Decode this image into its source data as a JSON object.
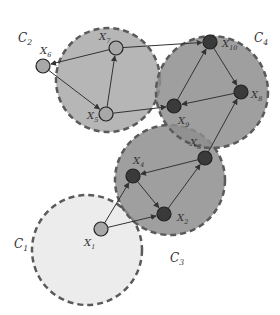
{
  "colors": {
    "c1_fill": "#e6e6e6",
    "c2_fill": "#a9a9a9",
    "c3_fill": "#8f8f8f",
    "c4_fill": "#8f8f8f",
    "border": "#5a5a5a",
    "node_light": "#a8a8a8",
    "node_dark": "#3a3a3a",
    "edge": "#333333"
  },
  "clusters": [
    {
      "id": "C1",
      "label": "C",
      "sub": "1",
      "cx": 87,
      "cy": 250,
      "r": 55,
      "fill": "#e9e9e9",
      "lx": 14,
      "ly": 248
    },
    {
      "id": "C2",
      "label": "C",
      "sub": "2",
      "cx": 108,
      "cy": 80,
      "r": 52,
      "fill": "#a9a9a9",
      "lx": 18,
      "ly": 42
    },
    {
      "id": "C3",
      "label": "C",
      "sub": "3",
      "cx": 170,
      "cy": 180,
      "r": 55,
      "fill": "#8e8e8e",
      "lx": 170,
      "ly": 262
    },
    {
      "id": "C4",
      "label": "C",
      "sub": "4",
      "cx": 212,
      "cy": 92,
      "r": 56,
      "fill": "#8e8e8e",
      "lx": 254,
      "ly": 42
    }
  ],
  "nodes": [
    {
      "id": "X1",
      "label": "X",
      "sub": "1",
      "x": 101,
      "y": 229,
      "dark": false,
      "lx": 84,
      "ly": 246
    },
    {
      "id": "X2",
      "label": "X",
      "sub": "2",
      "x": 164,
      "y": 214,
      "dark": true,
      "lx": 177,
      "ly": 221
    },
    {
      "id": "X3",
      "label": "X",
      "sub": "3",
      "x": 205,
      "y": 158,
      "dark": true,
      "lx": 190,
      "ly": 146
    },
    {
      "id": "X4",
      "label": "X",
      "sub": "4",
      "x": 133,
      "y": 176,
      "dark": true,
      "lx": 133,
      "ly": 164
    },
    {
      "id": "X5",
      "label": "X",
      "sub": "5",
      "x": 106,
      "y": 114,
      "dark": false,
      "lx": 87,
      "ly": 119
    },
    {
      "id": "X6",
      "label": "X",
      "sub": "6",
      "x": 43,
      "y": 66,
      "dark": false,
      "lx": 40,
      "ly": 54
    },
    {
      "id": "X7",
      "label": "X",
      "sub": "7",
      "x": 116,
      "y": 48,
      "dark": false,
      "lx": 99,
      "ly": 40
    },
    {
      "id": "X8",
      "label": "X",
      "sub": "8",
      "x": 241,
      "y": 92,
      "dark": true,
      "lx": 251,
      "ly": 98
    },
    {
      "id": "X9",
      "label": "X",
      "sub": "9",
      "x": 174,
      "y": 106,
      "dark": true,
      "lx": 178,
      "ly": 124
    },
    {
      "id": "X10",
      "label": "X",
      "sub": "10",
      "x": 210,
      "y": 42,
      "dark": true,
      "lx": 222,
      "ly": 47
    }
  ],
  "edges": [
    {
      "from": "X1",
      "to": "X4"
    },
    {
      "from": "X1",
      "to": "X2"
    },
    {
      "from": "X4",
      "to": "X2"
    },
    {
      "from": "X2",
      "to": "X3"
    },
    {
      "from": "X3",
      "to": "X4"
    },
    {
      "from": "X3",
      "to": "X8"
    },
    {
      "from": "X7",
      "to": "X6"
    },
    {
      "from": "X6",
      "to": "X5"
    },
    {
      "from": "X5",
      "to": "X7"
    },
    {
      "from": "X5",
      "to": "X9"
    },
    {
      "from": "X7",
      "to": "X10"
    },
    {
      "from": "X9",
      "to": "X10"
    },
    {
      "from": "X10",
      "to": "X8"
    },
    {
      "from": "X8",
      "to": "X9"
    }
  ]
}
